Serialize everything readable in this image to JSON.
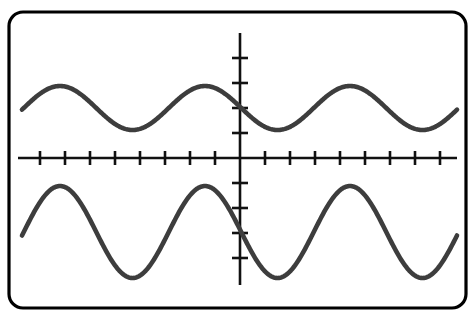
{
  "device": {
    "name": "graphing-calculator-screen",
    "bezel_color": "#000000",
    "screen_background": "#ffffff",
    "bezel_radius_px": 14,
    "bezel_stroke_px": 3.2,
    "bezel_rect": {
      "x": 9,
      "y": 12,
      "width": 457,
      "height": 296
    }
  },
  "chart_data": {
    "type": "line",
    "title": "",
    "subtitle": "",
    "xlabel": "",
    "ylabel": "",
    "grid": false,
    "legend": "none",
    "axis_color": "#111111",
    "curve_color": "#3d3d3d",
    "curve_stroke_px": 4.6,
    "axis_stroke_px": 2.6,
    "xlim": [
      -8.8,
      9.4
    ],
    "ylim": [
      -5.2,
      4.9
    ],
    "x_axis": {
      "pixel_y": 158,
      "pixel_x_start": 18,
      "pixel_x_end": 457,
      "tick_spacing_px": 25,
      "tick_half_length_px": 7,
      "ticks_left_of_origin": 8,
      "ticks_right_of_origin": 8,
      "tick_values": [
        -8,
        -7,
        -6,
        -5,
        -4,
        -3,
        -2,
        -1,
        1,
        2,
        3,
        4,
        5,
        6,
        7,
        8
      ],
      "tick_labels_visible": false
    },
    "y_axis": {
      "pixel_x": 240,
      "pixel_y_start": 33,
      "pixel_y_end": 285,
      "tick_spacing_px": 25,
      "tick_half_length_px": 8,
      "ticks_above_origin": 4,
      "ticks_below_origin": 4,
      "tick_values": [
        4,
        3,
        2,
        1,
        -1,
        -2,
        -3,
        -4
      ],
      "tick_labels_visible": false
    },
    "series": [
      {
        "name": "upper-sinusoid",
        "form": "y = A*cos(B*x) + D",
        "amplitude": 0.88,
        "amplitude_px": 22,
        "period_px": 145,
        "midline": 2.0,
        "midline_px_y": 108,
        "phase_px_at_peak": 60,
        "peak_px_y": 86,
        "trough_px_y": 130,
        "x_start_px": 22,
        "x_end_px": 457,
        "value_at_origin": 2.0,
        "descending_at_origin": true
      },
      {
        "name": "lower-sinusoid",
        "form": "y = A*cos(B*x) + D",
        "amplitude": 1.84,
        "amplitude_px": 46,
        "period_px": 145,
        "midline": -2.96,
        "midline_px_y": 232,
        "phase_px_at_peak": 60,
        "peak_px_y": 186,
        "trough_px_y": 278,
        "x_start_px": 22,
        "x_end_px": 457,
        "value_at_origin": -2.96,
        "descending_at_origin": true
      }
    ],
    "annotations": []
  }
}
